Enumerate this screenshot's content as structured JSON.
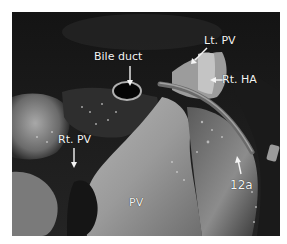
{
  "figure": {
    "type": "grayscale surgical photograph",
    "labels": [
      {
        "id": "bile-duct",
        "text": "Bile duct"
      },
      {
        "id": "lt-pv",
        "text": "Lt. PV"
      },
      {
        "id": "rt-ha",
        "text": "Rt. HA"
      },
      {
        "id": "rt-pv",
        "text": "Rt. PV"
      },
      {
        "id": "pv",
        "text": "PV"
      },
      {
        "id": "12a",
        "text": "12a"
      }
    ]
  }
}
